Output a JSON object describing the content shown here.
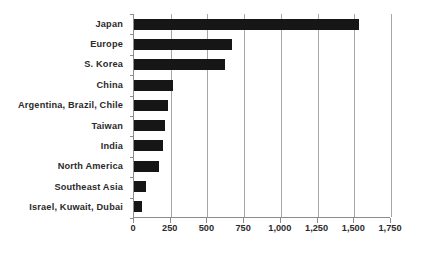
{
  "chart_data": {
    "type": "bar",
    "orientation": "horizontal",
    "title": "",
    "subtitle": "",
    "xlabel": "",
    "ylabel": "",
    "categories": [
      "Japan",
      "Europe",
      "S. Korea",
      "China",
      "Argentina, Brazil, Chile",
      "Taiwan",
      "India",
      "North America",
      "Southeast Asia",
      "Israel, Kuwait, Dubai"
    ],
    "values": [
      1530,
      670,
      620,
      265,
      230,
      210,
      195,
      170,
      80,
      55
    ],
    "xlim": [
      0,
      1750
    ],
    "xticks": [
      0,
      250,
      500,
      750,
      1000,
      1250,
      1500,
      1750
    ],
    "xtick_labels": [
      "0",
      "250",
      "500",
      "750",
      "1,000",
      "1,250",
      "1,500",
      "1,750"
    ],
    "grid": true,
    "grid_axis": "x",
    "legend": false,
    "legend_position": "none",
    "bar_color": "#161616",
    "grid_color": "#a6a6a6",
    "axis_color": "#8c8c8c",
    "label_color": "#2b2b2b",
    "background_color": "#ffffff"
  }
}
